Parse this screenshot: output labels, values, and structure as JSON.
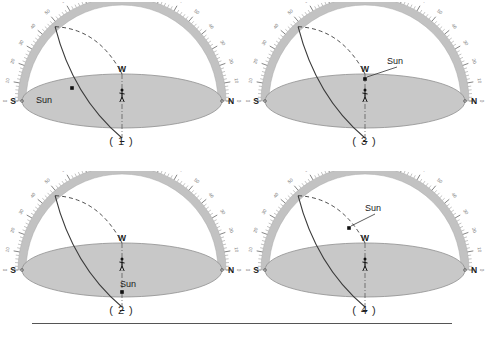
{
  "page": {
    "background_color": "#ffffff",
    "divider_color": "#555555"
  },
  "colors": {
    "arc_band": "#c2c2c2",
    "arc_band_edge": "#a8a8a8",
    "horizon_fill": "#c8c8c8",
    "horizon_edge": "#8f8f8f",
    "path_solid": "#3a3a3a",
    "path_dashed": "#3a3a3a",
    "label_text": "#1a1a1a",
    "tick_text": "#6e6e6e",
    "sun_marker": "#111111"
  },
  "scale": {
    "left_labels": [
      "0",
      "10",
      "20",
      "30",
      "40",
      "50",
      "60",
      "70",
      "80"
    ],
    "apex_label": "90",
    "right_labels": [
      "80",
      "70",
      "60",
      "50",
      "40",
      "30",
      "20",
      "10",
      "0"
    ],
    "major_step_degrees": 10,
    "minor_step_degrees": 2
  },
  "compass": {
    "south": "S",
    "north": "N",
    "west": "W",
    "east": "E"
  },
  "observer": {
    "name": "observer-figure"
  },
  "sun_label": "Sun",
  "diagrams": [
    {
      "id": "diagram-1",
      "caption": "( 1 )",
      "sun_position": "on-solid-path-upper-left",
      "sun_label_placement": "below-left-of-marker",
      "has_leader_line": false,
      "sun_x": 72,
      "sun_y": 86,
      "label_x": 44,
      "label_y": 101
    },
    {
      "id": "diagram-2",
      "caption": "( 2 )",
      "sun_position": "near-east-point-below-observer",
      "sun_label_placement": "right-of-east",
      "has_leader_line": false,
      "sun_x": 122,
      "sun_y": 121,
      "label_x": 128,
      "label_y": 116
    },
    {
      "id": "diagram-3",
      "caption": "( 3 )",
      "sun_position": "at-west-point-on-horizon",
      "sun_label_placement": "upper-right-with-leader",
      "has_leader_line": true,
      "sun_x": 122,
      "sun_y": 77,
      "label_x": 152,
      "label_y": 62
    },
    {
      "id": "diagram-4",
      "caption": "( 4 )",
      "sun_position": "on-dashed-arc-mid-sky",
      "sun_label_placement": "upper-right-with-leader",
      "has_leader_line": true,
      "sun_x": 106,
      "sun_y": 57,
      "label_x": 130,
      "label_y": 40
    }
  ]
}
